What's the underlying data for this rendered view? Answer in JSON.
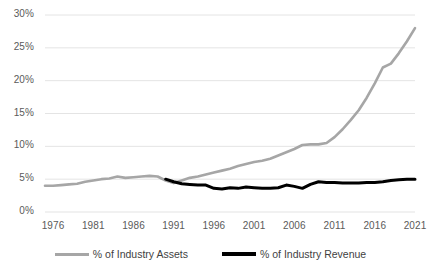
{
  "chart_data": {
    "type": "line",
    "title": "",
    "xlabel": "",
    "ylabel": "",
    "xlim": [
      1975,
      2021
    ],
    "ylim": [
      0,
      30
    ],
    "grid": true,
    "legend_position": "bottom",
    "y_ticks": [
      "0%",
      "5%",
      "10%",
      "15%",
      "20%",
      "25%",
      "30%"
    ],
    "y_tick_values": [
      0,
      5,
      10,
      15,
      20,
      25,
      30
    ],
    "x_ticks": [
      "1976",
      "1981",
      "1986",
      "1991",
      "1996",
      "2001",
      "2006",
      "2011",
      "2016",
      "2021"
    ],
    "x_tick_values": [
      1976,
      1981,
      1986,
      1991,
      1996,
      2001,
      2006,
      2011,
      2016,
      2021
    ],
    "colors": {
      "assets_line": "#a6a6a6",
      "revenue_line": "#000000",
      "gridline": "#e4e4e4",
      "tick_text": "#5a5a5a",
      "legend_text": "#3f3f3f",
      "background": "#ffffff"
    },
    "series": [
      {
        "name": "% of Industry Assets",
        "color": "#a6a6a6",
        "x": [
          1975,
          1976,
          1977,
          1978,
          1979,
          1980,
          1981,
          1982,
          1983,
          1984,
          1985,
          1986,
          1987,
          1988,
          1989,
          1990,
          1991,
          1992,
          1993,
          1994,
          1995,
          1996,
          1997,
          1998,
          1999,
          2000,
          2001,
          2002,
          2003,
          2004,
          2005,
          2006,
          2007,
          2008,
          2009,
          2010,
          2011,
          2012,
          2013,
          2014,
          2015,
          2016,
          2017,
          2018,
          2019,
          2020,
          2021
        ],
        "values": [
          4.0,
          4.0,
          4.1,
          4.2,
          4.3,
          4.6,
          4.8,
          5.0,
          5.1,
          5.4,
          5.2,
          5.3,
          5.4,
          5.5,
          5.4,
          4.8,
          4.4,
          4.8,
          5.2,
          5.4,
          5.7,
          6.0,
          6.3,
          6.6,
          7.0,
          7.3,
          7.6,
          7.8,
          8.1,
          8.6,
          9.1,
          9.6,
          10.2,
          10.3,
          10.3,
          10.5,
          11.4,
          12.6,
          14.0,
          15.5,
          17.4,
          19.6,
          22.0,
          22.6,
          24.2,
          26.0,
          28.0
        ]
      },
      {
        "name": "% of Industry Revenue",
        "color": "#000000",
        "x": [
          1990,
          1991,
          1992,
          1993,
          1994,
          1995,
          1996,
          1997,
          1998,
          1999,
          2000,
          2001,
          2002,
          2003,
          2004,
          2005,
          2006,
          2007,
          2008,
          2009,
          2010,
          2011,
          2012,
          2013,
          2014,
          2015,
          2016,
          2017,
          2018,
          2019,
          2020,
          2021
        ],
        "values": [
          5.0,
          4.6,
          4.3,
          4.2,
          4.1,
          4.1,
          3.6,
          3.5,
          3.7,
          3.6,
          3.8,
          3.7,
          3.6,
          3.6,
          3.7,
          4.1,
          3.9,
          3.6,
          4.2,
          4.6,
          4.5,
          4.5,
          4.4,
          4.4,
          4.4,
          4.5,
          4.5,
          4.6,
          4.8,
          4.9,
          5.0,
          5.0
        ]
      }
    ]
  }
}
